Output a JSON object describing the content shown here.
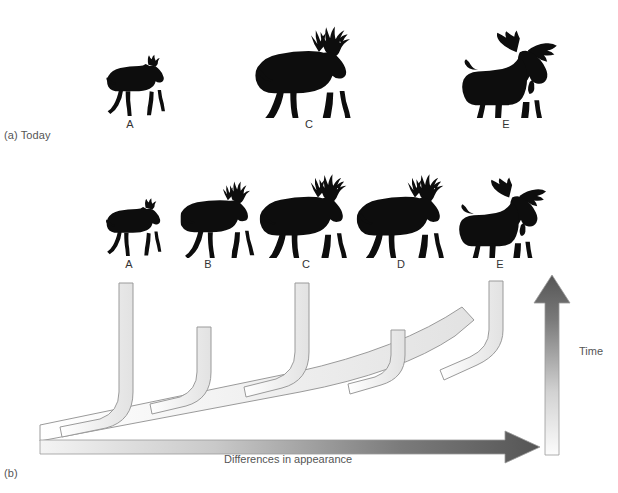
{
  "figure": {
    "panels": [
      {
        "id": "a",
        "label": "(a) Today"
      },
      {
        "id": "b",
        "label": "(b)"
      }
    ]
  },
  "panel_a": {
    "label": "(a) Today",
    "caption": "Today",
    "animals": [
      {
        "id": "A",
        "label": "A",
        "kind": "small-deer-silhouette",
        "x": 100,
        "y": 46,
        "w": 70,
        "h": 72
      },
      {
        "id": "C",
        "label": "C",
        "kind": "large-antlered-deer-silhouette",
        "x": 253,
        "y": 24,
        "w": 108,
        "h": 94
      },
      {
        "id": "E",
        "label": "E",
        "kind": "moose-silhouette",
        "x": 455,
        "y": 20,
        "w": 112,
        "h": 98
      }
    ]
  },
  "panel_b": {
    "label": "(b)",
    "animals": [
      {
        "id": "A",
        "label": "A",
        "kind": "small-deer-silhouette",
        "x": 100,
        "y": 190,
        "w": 66,
        "h": 68
      },
      {
        "id": "B",
        "label": "B",
        "kind": "antlered-deer-silhouette",
        "x": 180,
        "y": 178,
        "w": 80,
        "h": 80
      },
      {
        "id": "C",
        "label": "C",
        "kind": "large-antlered-deer-silhouette",
        "x": 258,
        "y": 172,
        "w": 98,
        "h": 86
      },
      {
        "id": "D",
        "label": "D",
        "kind": "large-antlered-deer-silhouette",
        "x": 355,
        "y": 172,
        "w": 98,
        "h": 86
      },
      {
        "id": "E",
        "label": "E",
        "kind": "moose-silhouette",
        "x": 452,
        "y": 168,
        "w": 104,
        "h": 90
      }
    ],
    "tree": {
      "description": "Branching evolutionary tree: a common ancestral trunk rises from lower-left and successively splits into five lineages leading to taxa A through E.",
      "branch_tips": [
        {
          "taxon": "A",
          "x": 128,
          "y": 283
        },
        {
          "taxon": "B",
          "x": 206,
          "y": 327
        },
        {
          "taxon": "C",
          "x": 304,
          "y": 283
        },
        {
          "taxon": "D",
          "x": 399,
          "y": 330
        },
        {
          "taxon": "E",
          "x": 499,
          "y": 281
        }
      ],
      "trunk_start": {
        "x": 40,
        "y": 436
      },
      "fill_color": "#f2f2f2",
      "stroke_color": "#9a9a9a"
    },
    "axes": {
      "horizontal": {
        "label": "Differences in appearance",
        "direction": "left-to-right",
        "gradient_from": "#f0f0f0",
        "gradient_to": "#5d5d5d"
      },
      "vertical": {
        "label": "Time",
        "direction": "bottom-to-top",
        "gradient_from": "#fafafa",
        "gradient_to": "#5d5d5d"
      }
    }
  }
}
